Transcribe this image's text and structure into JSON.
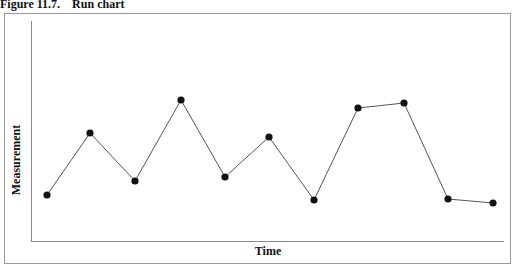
{
  "figure": {
    "number": "Figure 11.7.",
    "title": "Run chart",
    "caption": "Figure 11.7.    Run chart"
  },
  "chart_data": {
    "type": "line",
    "title": "Run chart",
    "xlabel": "Time",
    "ylabel": "Measurement",
    "x": [
      1,
      2,
      3,
      4,
      5,
      6,
      7,
      8,
      9,
      10,
      11
    ],
    "series": [
      {
        "name": "Measurement",
        "values": [
          1.0,
          2.6,
          1.4,
          3.4,
          1.5,
          2.5,
          0.9,
          3.2,
          3.3,
          0.9,
          0.8
        ]
      }
    ],
    "pixel_points": [
      [
        47,
        195
      ],
      [
        90,
        133
      ],
      [
        135,
        181
      ],
      [
        181,
        100
      ],
      [
        225,
        177
      ],
      [
        269,
        137
      ],
      [
        314,
        200
      ],
      [
        358,
        108
      ],
      [
        404,
        103
      ],
      [
        448,
        199
      ],
      [
        493,
        203
      ]
    ],
    "axis_ticks": "none",
    "grid": false,
    "legend": "none",
    "marker": "filled-circle",
    "line_color": "#555555",
    "marker_color": "#111111"
  }
}
